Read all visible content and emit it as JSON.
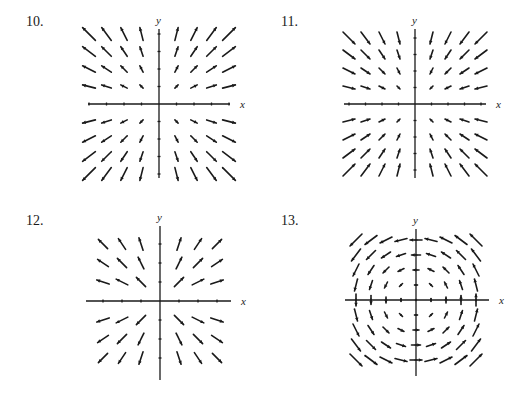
{
  "problems": [
    {
      "number": "10.",
      "x_label": "x",
      "y_label": "y",
      "description": "Outward radial field, magnitude grows with distance",
      "axes": {
        "cx": 159,
        "cy": 104,
        "xmin": 88,
        "xmax": 230,
        "ymin": 29,
        "ymax": 178
      },
      "grid": {
        "xs": [
          -4,
          -3,
          -2,
          -1,
          1,
          2,
          3,
          4
        ],
        "ys": [
          -4,
          -3,
          -2,
          -1,
          1,
          2,
          3,
          4
        ],
        "spacing": 17.5
      },
      "field": "radial_out_scaled"
    },
    {
      "number": "11.",
      "x_label": "x",
      "y_label": "y",
      "description": "Inward radial field, magnitude grows with distance",
      "axes": {
        "cx": 415,
        "cy": 104,
        "xmin": 344,
        "xmax": 486,
        "ymin": 29,
        "ymax": 178
      },
      "grid": {
        "xs": [
          -4,
          -3,
          -2,
          -1,
          1,
          2,
          3,
          4
        ],
        "ys": [
          -4,
          -3,
          -2,
          -1,
          1,
          2,
          3,
          4
        ],
        "spacing": 16.5
      },
      "field": "radial_in_scaled"
    },
    {
      "number": "12.",
      "x_label": "x",
      "y_label": "y",
      "description": "Outward radial unit field (constant length)",
      "axes": {
        "cx": 160,
        "cy": 301,
        "xmin": 86,
        "xmax": 231,
        "ymin": 226,
        "ymax": 380
      },
      "grid": {
        "xs": [
          -3,
          -2,
          -1,
          1,
          2,
          3
        ],
        "ys": [
          -3,
          -2,
          -1,
          1,
          2,
          3
        ],
        "spacing": 19
      },
      "field": "radial_out_unit"
    },
    {
      "number": "13.",
      "x_label": "x",
      "y_label": "y",
      "description": "Counterclockwise rotational field",
      "axes": {
        "cx": 416,
        "cy": 300,
        "xmin": 345,
        "xmax": 489,
        "ymin": 229,
        "ymax": 376
      },
      "grid": {
        "xs": [
          -4,
          -3,
          -2,
          -1,
          0,
          1,
          2,
          3,
          4
        ],
        "ys": [
          -4,
          -3,
          -2,
          -1,
          0,
          1,
          2,
          3,
          4
        ],
        "spacing": 15
      },
      "field": "rotation_ccw"
    }
  ],
  "colors": {
    "ink": "#1a1a1a",
    "background": "#ffffff"
  }
}
